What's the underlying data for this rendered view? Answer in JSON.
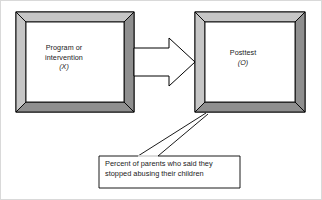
{
  "diagram": {
    "type": "one-group-posttest-only-design",
    "boxes": [
      {
        "id": "program-box",
        "name": "program-or-intervention-box",
        "line1": "Program or",
        "line2": "intervention",
        "symbol": "(X)",
        "style": "beveled-3d-frame"
      },
      {
        "id": "posttest-box",
        "name": "posttest-box",
        "line1": "Posttest",
        "line2": "",
        "symbol": "(O)",
        "style": "beveled-3d-frame"
      }
    ],
    "arrow": {
      "name": "block-arrow",
      "direction": "left-to-right",
      "from": "program-box",
      "to": "posttest-box"
    },
    "callout": {
      "name": "posttest-measure-callout",
      "line1": "Percent of parents who said they",
      "line2": "stopped abusing their children",
      "target": "posttest-box",
      "leader_lines": 2
    },
    "colors": {
      "bevel_light": "#c6c6c6",
      "bevel_dark": "#8f8f8f",
      "outline": "#000000",
      "box_fill": "#ffffff",
      "page_background": "#ffffff",
      "page_border": "#d9d9d9",
      "text": "#1a1a1a"
    }
  }
}
